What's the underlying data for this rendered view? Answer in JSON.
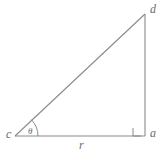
{
  "figure": {
    "type": "right-triangle-diagram",
    "background_color": "#ffffff",
    "stroke_color": "#8a8a8a",
    "label_color": "#6b6b6b",
    "width": 167,
    "height": 155
  },
  "vertices": {
    "c": {
      "label": "c",
      "x": 15,
      "y": 136,
      "description": "left vertex with angle theta"
    },
    "a": {
      "label": "a",
      "x": 145,
      "y": 136,
      "description": "bottom-right vertex, right angle"
    },
    "d": {
      "label": "d",
      "x": 145,
      "y": 14,
      "description": "top-right vertex"
    }
  },
  "sides": {
    "base": {
      "label": "r",
      "from": "c",
      "to": "a"
    },
    "vertical": {
      "label": "",
      "from": "a",
      "to": "d"
    },
    "hypotenuse": {
      "label": "",
      "from": "c",
      "to": "d"
    }
  },
  "angles": {
    "theta": {
      "label": "θ",
      "at_vertex": "c"
    },
    "right_angle": {
      "label": "",
      "at_vertex": "a",
      "marker": "square"
    }
  }
}
